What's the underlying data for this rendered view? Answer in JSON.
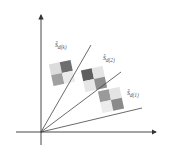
{
  "diagram": {
    "axes": {
      "origin": [
        41,
        132
      ],
      "y_axis": {
        "from": [
          41,
          145
        ],
        "to": [
          41,
          14
        ]
      },
      "x_axis": {
        "from": [
          16,
          132
        ],
        "to": [
          157,
          132
        ]
      },
      "color": "#333333"
    },
    "rays": [
      {
        "id": "k",
        "end": [
          91,
          45
        ]
      },
      {
        "id": "2",
        "end": [
          121,
          72
        ]
      },
      {
        "id": "1",
        "end": [
          142,
          108
        ]
      }
    ],
    "labels": [
      {
        "id": "k",
        "base": "s",
        "sup": "*",
        "sub": "d(k)",
        "pos": [
          55,
          40
        ]
      },
      {
        "id": "2",
        "base": "s",
        "sup": "*",
        "sub": "d(2)",
        "pos": [
          103,
          53
        ]
      },
      {
        "id": "1",
        "base": "s",
        "sup": "*",
        "sub": "d(1)",
        "pos": [
          127,
          88
        ]
      }
    ],
    "patches": [
      {
        "id": "k",
        "center": [
          62,
          73
        ],
        "rotate": -12,
        "cells": [
          "#dcdcdc",
          "#6f6f6f",
          "#a0a0a0",
          "#ececec"
        ]
      },
      {
        "id": "2",
        "center": [
          94,
          79
        ],
        "rotate": -12,
        "cells": [
          "#5f5f5f",
          "#e4e4e4",
          "#e6e6e6",
          "#8e8e8e"
        ]
      },
      {
        "id": "1",
        "center": [
          111,
          100
        ],
        "rotate": -12,
        "cells": [
          "#9a9a9a",
          "#e4e4e4",
          "#ececec",
          "#8a8a8a"
        ]
      }
    ]
  }
}
